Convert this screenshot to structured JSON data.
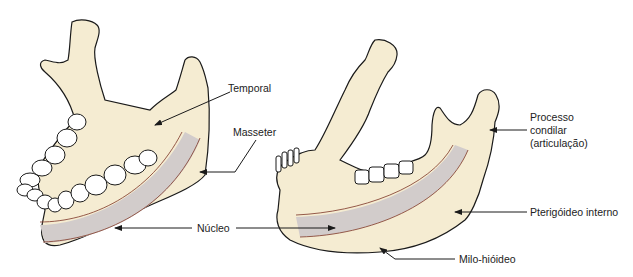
{
  "diagram": {
    "colors": {
      "bone": "#f5ecd2",
      "outline": "#1a1a1a",
      "nucleus_band": "#d2cccb",
      "band_edge": "#8a4a3a",
      "text": "#222222"
    },
    "labels": {
      "temporal": "Temporal",
      "masseter": "Masseter",
      "nucleo": "Núcleo",
      "processo_l1": "Processo",
      "processo_l2": "condilar",
      "processo_l3": "(articulação)",
      "pterigoideo": "Pterigóideo interno",
      "milo": "Milo-hióideo"
    }
  }
}
